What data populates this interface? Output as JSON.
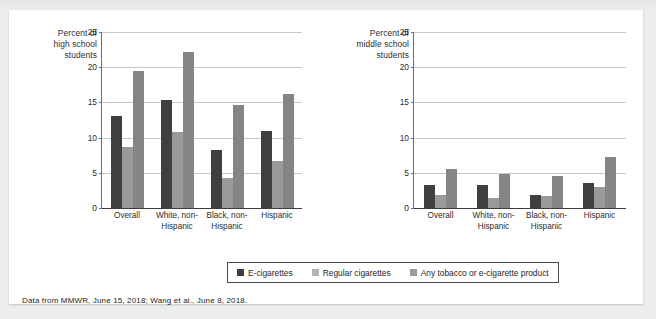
{
  "caption": "Data from MMWR, June 15, 2018; Wang et al., June 8, 2018.",
  "legend": {
    "items": [
      {
        "label": "E-cigarettes",
        "color": "#3f3f3f",
        "icon": "legend-swatch-icon"
      },
      {
        "label": "Regular cigarettes",
        "color": "#b4b4b4",
        "icon": "legend-swatch-icon"
      },
      {
        "label": "Any tobacco or e-cigarette product",
        "color": "#9b9b9b",
        "icon": "legend-swatch-icon"
      }
    ]
  },
  "chart_data": [
    {
      "type": "bar",
      "id": "high-school",
      "title": "",
      "ylabel": "Percent of high school students",
      "ylabel_lines": [
        "Percent of",
        "high school",
        "students"
      ],
      "xlabel": "",
      "ylim": [
        0,
        25
      ],
      "yticks": [
        0,
        5,
        10,
        15,
        20,
        25
      ],
      "ytick_labels": [
        "0",
        "5",
        "10",
        "15",
        "20",
        "25"
      ],
      "grid": true,
      "legend_position": "bottom-center",
      "categories": [
        "Overall",
        "White, non-Hispanic",
        "Black, non-Hispanic",
        "Hispanic"
      ],
      "category_lines": [
        [
          "Overall",
          ""
        ],
        [
          "White, non-",
          "Hispanic"
        ],
        [
          "Black, non-",
          "Hispanic"
        ],
        [
          "Hispanic",
          ""
        ]
      ],
      "series": [
        {
          "name": "E-cigarettes",
          "color": "#3f3f3f",
          "values": [
            13.1,
            15.4,
            8.3,
            11.0
          ]
        },
        {
          "name": "Regular cigarettes",
          "color": "#9a9a9a",
          "values": [
            8.7,
            10.8,
            4.2,
            6.7
          ]
        },
        {
          "name": "Any tobacco or e-cigarette product",
          "color": "#858585",
          "values": [
            19.4,
            22.2,
            14.6,
            16.2
          ]
        }
      ]
    },
    {
      "type": "bar",
      "id": "middle-school",
      "title": "",
      "ylabel": "Percent of middle school students",
      "ylabel_lines": [
        "Percent of",
        "middle school",
        "students"
      ],
      "xlabel": "",
      "ylim": [
        0,
        25
      ],
      "yticks": [
        0,
        5,
        10,
        15,
        20,
        25
      ],
      "ytick_labels": [
        "0",
        "5",
        "10",
        "15",
        "20",
        "25"
      ],
      "grid": true,
      "legend_position": "bottom-center",
      "categories": [
        "Overall",
        "White, non-Hispanic",
        "Black, non-Hispanic",
        "Hispanic"
      ],
      "category_lines": [
        [
          "Overall",
          ""
        ],
        [
          "White, non-",
          "Hispanic"
        ],
        [
          "Black, non-",
          "Hispanic"
        ],
        [
          "Hispanic",
          ""
        ]
      ],
      "series": [
        {
          "name": "E-cigarettes",
          "color": "#3f3f3f",
          "values": [
            3.3,
            3.3,
            1.9,
            3.6
          ]
        },
        {
          "name": "Regular cigarettes",
          "color": "#9a9a9a",
          "values": [
            1.8,
            1.4,
            1.7,
            3.0
          ]
        },
        {
          "name": "Any tobacco or e-cigarette product",
          "color": "#858585",
          "values": [
            5.5,
            4.9,
            4.6,
            7.3
          ]
        }
      ]
    }
  ]
}
